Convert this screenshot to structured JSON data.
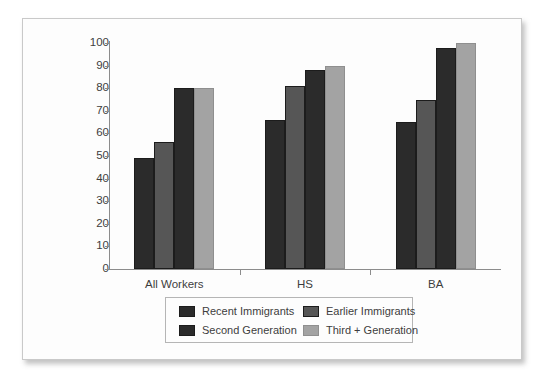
{
  "chart_data": {
    "type": "bar",
    "title": "",
    "subtitle": "",
    "xlabel": "",
    "ylabel": "",
    "categories": [
      "All Workers",
      "HS",
      "BA"
    ],
    "series": [
      {
        "name": "Recent Immigrants",
        "color": "#2b2b2b",
        "values": [
          49,
          66,
          65
        ]
      },
      {
        "name": "Earlier Immigrants",
        "color": "#565656",
        "values": [
          56,
          81,
          75
        ]
      },
      {
        "name": "Second Generation",
        "color": "#2b2b2b",
        "values": [
          80,
          88,
          98
        ]
      },
      {
        "name": "Third + Generation",
        "color": "#a3a3a3",
        "values": [
          80,
          90,
          100
        ]
      }
    ],
    "ylim": [
      0,
      100
    ],
    "ytick_step": 10,
    "yticks": [
      "100",
      "90",
      "80",
      "70",
      "60",
      "50",
      "40",
      "30",
      "20",
      "10",
      "0"
    ],
    "grid": false,
    "legend_position": "bottom",
    "legend_entries": [
      "Recent Immigrants",
      "Earlier Immigrants",
      "Second Generation",
      "Third + Generation"
    ]
  },
  "panel": {
    "background_color": "#fdfdfd",
    "border_color": "#c9c9c9"
  },
  "axis": {
    "line_color": "#8c8c8c",
    "tick_text_color": "#3d3d3d"
  }
}
